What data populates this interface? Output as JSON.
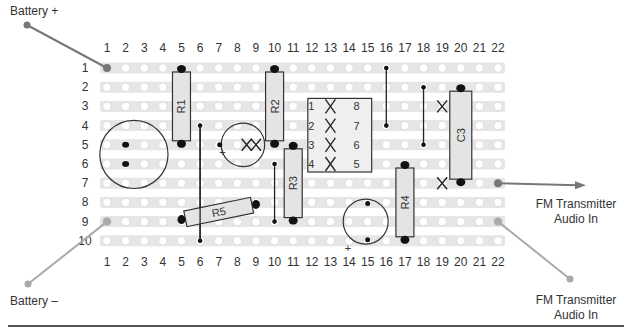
{
  "labels": {
    "battery_plus": "Battery +",
    "battery_minus": "Battery –",
    "fm_out_line1": "FM Transmitter",
    "fm_out_line2": "Audio In",
    "fm_gnd_line1": "FM Transmitter",
    "fm_gnd_line2": "Audio In"
  },
  "grid": {
    "columns": 22,
    "rows": 10,
    "col_x0": 107,
    "col_pitch": 18.62,
    "row_y0": 68,
    "row_pitch": 19.2,
    "top_col_label_y": 52,
    "bottom_col_label_y": 266,
    "row_label_x": 85
  },
  "colors": {
    "strip": "#e6e6e6",
    "hole": "#ffffff",
    "cut": "#d2d2d2",
    "component_fill": "#e4e4e4",
    "outline": "#333333",
    "solder": "#111111",
    "wire_gray": "#888888",
    "wire_light": "#aaaaaa"
  },
  "components": {
    "resistors": [
      {
        "id": "R1",
        "label": "R1",
        "col": 5,
        "row_start": 1,
        "row_end": 5
      },
      {
        "id": "R2",
        "label": "R2",
        "col": 10,
        "row_start": 1,
        "row_end": 5
      },
      {
        "id": "R3",
        "label": "R3",
        "col": 11,
        "row_start": 5,
        "row_end": 9
      },
      {
        "id": "R4",
        "label": "R4",
        "col": 17,
        "row_start": 6,
        "row_end": 10
      },
      {
        "id": "C3",
        "label": "C3",
        "col": 20,
        "row_start": 2,
        "row_end": 7
      }
    ],
    "r5": {
      "label": "R5",
      "from": [
        5,
        9
      ],
      "to": [
        9,
        8
      ]
    },
    "ic": {
      "col_left": 12,
      "col_right": 15,
      "row_top": 3,
      "row_bottom": 6,
      "pins_left": [
        "1",
        "2",
        "3",
        "4"
      ],
      "pins_right": [
        "8",
        "7",
        "6",
        "5"
      ]
    },
    "mic_large": {
      "center_col": 2.5,
      "center_row": 5.5,
      "radius": 22,
      "pins": [
        [
          2,
          5
        ],
        [
          2,
          6
        ]
      ]
    },
    "cap_c1": {
      "center_col": 8.3,
      "center_row": 5,
      "radius": 15,
      "pins": [
        [
          7,
          5
        ],
        [
          10,
          5
        ]
      ],
      "plus": "+"
    },
    "cap_c2": {
      "center_col": 15,
      "center_row": 9,
      "radius": 15,
      "pins": [
        [
          15,
          8
        ],
        [
          15,
          10
        ]
      ],
      "plus": "+"
    }
  },
  "wires": [
    {
      "from": [
        6,
        4
      ],
      "to": [
        6,
        10
      ]
    },
    {
      "from": [
        10,
        6
      ],
      "to": [
        10,
        9
      ]
    },
    {
      "from": [
        16,
        1
      ],
      "to": [
        16,
        4
      ]
    },
    {
      "from": [
        18,
        2
      ],
      "to": [
        18,
        5
      ]
    }
  ],
  "track_cuts": [
    {
      "col": 19,
      "row": 3
    },
    {
      "col": 19,
      "row": 7
    },
    {
      "col": 9,
      "row": 5
    }
  ]
}
